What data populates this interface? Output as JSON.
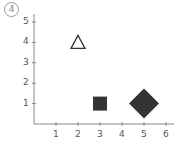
{
  "problem_label": "4",
  "chart_data": {
    "type": "scatter",
    "title": "",
    "xlabel": "",
    "ylabel": "",
    "xlim": [
      0,
      6.3
    ],
    "ylim": [
      0,
      5.6
    ],
    "grid": false,
    "x_ticks": [
      "1",
      "2",
      "3",
      "4",
      "5",
      "6"
    ],
    "y_ticks": [
      "1",
      "2",
      "3",
      "4",
      "5"
    ],
    "points": [
      {
        "marker": "triangle-open",
        "x": 2,
        "y": 4,
        "size": "small",
        "color": "#333333"
      },
      {
        "marker": "square-filled",
        "x": 3,
        "y": 1,
        "size": "small",
        "color": "#333333"
      },
      {
        "marker": "diamond-filled",
        "x": 5,
        "y": 1,
        "size": "large",
        "color": "#333333"
      }
    ]
  },
  "colors": {
    "axis": "#888888",
    "marker": "#333333",
    "text": "#555555"
  }
}
